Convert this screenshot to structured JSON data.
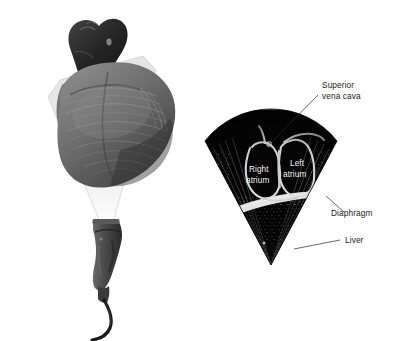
{
  "figure": {
    "background_color": "#ffffff",
    "panels": [
      {
        "id": "anatomy-panel",
        "name": "heart-with-transducer",
        "description": "Grayscale anatomical drawing of the heart with an ultrasound transducer probe below, the scan beam shown as a translucent fan passing through the heart"
      },
      {
        "id": "ultrasound-panel",
        "name": "ultrasound-sector-image",
        "description": "Black-and-white ultrasound sector scan showing the right atrium, left atrium, superior vena cava, diaphragm and liver"
      }
    ]
  },
  "anatomy": {
    "beam_fill": "#d8d8d8",
    "beam_opacity": 0.55,
    "heart_body_color": "#6f6f6f",
    "heart_shadow_color": "#3a3a3a",
    "great_vessel_color": "#262626",
    "probe_color": "#4a4a4a",
    "cable_color": "#1d1d1d",
    "parts": [
      {
        "name": "aorta-and-great-vessels"
      },
      {
        "name": "pulmonary-artery"
      },
      {
        "name": "right-atrium-appendage"
      },
      {
        "name": "left-ventricle-mass"
      },
      {
        "name": "right-ventricle-mass"
      },
      {
        "name": "ultrasound-beam-fan"
      },
      {
        "name": "transducer-probe"
      },
      {
        "name": "transducer-cable"
      }
    ]
  },
  "ultrasound": {
    "sector_fill": "#050505",
    "speckle_color": "#cfcfcf",
    "structure_outline_color": "#f0f0f0",
    "diaphragm_band_color": "#f5f5f5",
    "apex": {
      "x": 271,
      "y": 265
    },
    "structures": [
      {
        "name": "right-atrium",
        "label": "Right atrium"
      },
      {
        "name": "left-atrium",
        "label": "Left atrium"
      },
      {
        "name": "superior-vena-cava",
        "label": "Superior vena cava"
      },
      {
        "name": "diaphragm",
        "label": "Diaphragm"
      },
      {
        "name": "liver",
        "label": "Liver"
      }
    ]
  },
  "labels": {
    "superior_vena_cava_line1": "Superior",
    "superior_vena_cava_line2": "vena cava",
    "right_atrium_line1": "Right",
    "right_atrium_line2": "atrium",
    "left_atrium_line1": "Left",
    "left_atrium_line2": "atrium",
    "diaphragm": "Diaphragm",
    "liver": "Liver"
  }
}
